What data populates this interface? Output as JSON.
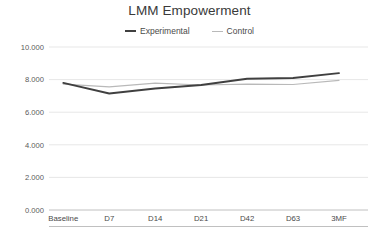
{
  "chart_data": {
    "type": "line",
    "title": "LMM Empowerment",
    "xlabel": "",
    "ylabel": "",
    "categories": [
      "Baseline",
      "D7",
      "D14",
      "D21",
      "D42",
      "D63",
      "3MF"
    ],
    "series": [
      {
        "name": "Experimental",
        "color": "#404040",
        "values": [
          7.8,
          7.15,
          7.45,
          7.67,
          8.05,
          8.1,
          8.4
        ]
      },
      {
        "name": "Control",
        "color": "#b9b9b9",
        "values": [
          7.72,
          7.55,
          7.78,
          7.67,
          7.72,
          7.7,
          7.95
        ]
      }
    ],
    "ylim": [
      0,
      10
    ],
    "ytick_values": [
      0,
      2,
      4,
      6,
      8,
      10
    ],
    "ytick_labels": [
      "0.000",
      "2.000",
      "4.000",
      "6.000",
      "8.000",
      "10.000"
    ],
    "grid": "horizontal",
    "legend_position": "top-center",
    "background": "#ffffff"
  },
  "legend": {
    "items": [
      {
        "label": "Experimental"
      },
      {
        "label": "Control"
      }
    ]
  }
}
